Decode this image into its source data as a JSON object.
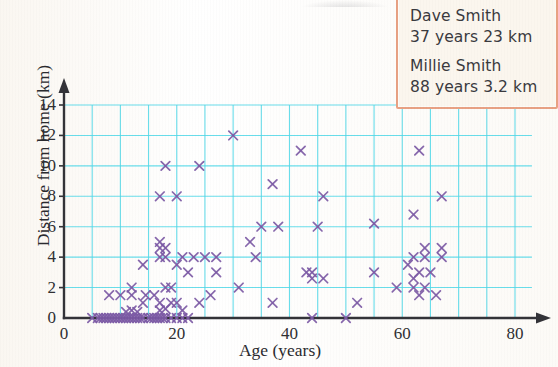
{
  "chart_data": {
    "type": "scatter",
    "title": "",
    "xlabel": "Age (years)",
    "ylabel": "Distance from home (km)",
    "xlim": [
      0,
      80
    ],
    "ylim": [
      0,
      14
    ],
    "xticks": [
      0,
      20,
      40,
      60,
      80
    ],
    "yticks": [
      0,
      2,
      4,
      6,
      8,
      10,
      12,
      14
    ],
    "x_gridline_step": 5,
    "y_gridline_step": 2,
    "grid": true,
    "grid_color": "#4fd8e8",
    "marker": "x",
    "marker_color": "#7d5ba6",
    "axis_color": "#333338",
    "legend": "none",
    "points": [
      [
        5,
        0
      ],
      [
        6,
        0
      ],
      [
        6.5,
        0
      ],
      [
        7,
        0
      ],
      [
        7.5,
        0
      ],
      [
        8,
        0
      ],
      [
        8.5,
        0
      ],
      [
        9,
        0
      ],
      [
        9.5,
        0
      ],
      [
        10,
        0
      ],
      [
        10.5,
        0
      ],
      [
        11,
        0
      ],
      [
        11.5,
        0
      ],
      [
        12,
        0
      ],
      [
        12.5,
        0
      ],
      [
        13,
        0
      ],
      [
        13.5,
        0
      ],
      [
        14,
        0
      ],
      [
        15,
        0
      ],
      [
        15.5,
        0
      ],
      [
        16,
        0
      ],
      [
        16.5,
        0
      ],
      [
        17,
        0
      ],
      [
        17.5,
        0
      ],
      [
        18,
        0
      ],
      [
        19,
        0
      ],
      [
        20,
        0
      ],
      [
        21,
        0
      ],
      [
        22,
        0
      ],
      [
        44,
        0
      ],
      [
        50,
        0
      ],
      [
        11,
        0.4
      ],
      [
        12,
        0.5
      ],
      [
        13,
        0.4
      ],
      [
        17,
        0.5
      ],
      [
        18,
        0.6
      ],
      [
        21,
        0.5
      ],
      [
        14,
        1
      ],
      [
        17,
        1
      ],
      [
        19,
        1
      ],
      [
        20,
        1
      ],
      [
        24,
        1
      ],
      [
        37,
        1
      ],
      [
        52,
        1
      ],
      [
        8,
        1.5
      ],
      [
        10,
        1.5
      ],
      [
        12,
        1.5
      ],
      [
        14.5,
        1.5
      ],
      [
        16,
        1.5
      ],
      [
        26,
        1.5
      ],
      [
        63,
        1.5
      ],
      [
        66,
        1.5
      ],
      [
        12,
        2
      ],
      [
        18,
        2
      ],
      [
        19,
        2
      ],
      [
        31,
        2
      ],
      [
        59,
        2
      ],
      [
        62,
        2
      ],
      [
        64,
        2
      ],
      [
        44,
        2.6
      ],
      [
        46,
        2.6
      ],
      [
        62,
        2.6
      ],
      [
        22,
        3
      ],
      [
        27,
        3
      ],
      [
        43,
        3
      ],
      [
        44,
        3
      ],
      [
        55,
        3
      ],
      [
        63,
        3
      ],
      [
        65,
        3
      ],
      [
        14,
        3.5
      ],
      [
        20,
        3.5
      ],
      [
        61,
        3.5
      ],
      [
        17,
        4
      ],
      [
        18,
        4
      ],
      [
        21,
        4
      ],
      [
        23,
        4
      ],
      [
        25,
        4
      ],
      [
        27,
        4
      ],
      [
        34,
        4
      ],
      [
        62,
        4
      ],
      [
        64,
        4
      ],
      [
        67,
        4
      ],
      [
        17,
        4.6
      ],
      [
        18,
        4.6
      ],
      [
        64,
        4.6
      ],
      [
        67,
        4.6
      ],
      [
        17,
        5
      ],
      [
        33,
        5
      ],
      [
        35,
        6
      ],
      [
        38,
        6
      ],
      [
        45,
        6
      ],
      [
        55,
        6.2
      ],
      [
        62,
        6.8
      ],
      [
        17,
        8
      ],
      [
        20,
        8
      ],
      [
        46,
        8
      ],
      [
        67,
        8
      ],
      [
        18,
        10
      ],
      [
        24,
        10
      ],
      [
        37,
        8.8
      ],
      [
        30,
        12
      ],
      [
        42,
        11
      ],
      [
        63,
        11
      ]
    ],
    "annotations": {
      "callout": {
        "entries": [
          {
            "name": "Dave Smith",
            "detail": "37 years 23 km"
          },
          {
            "name": "Millie Smith",
            "detail": "88 years 3.2 km"
          }
        ],
        "border_color": "#e8a183",
        "background_color": "#fbf6ee"
      }
    }
  },
  "axis": {
    "y_title": "Distance from home (km)",
    "x_title": "Age (years)",
    "y_tick_labels": [
      "0",
      "2",
      "4",
      "6",
      "8",
      "10",
      "12",
      "14"
    ],
    "x_tick_labels": [
      "0",
      "20",
      "40",
      "60",
      "80"
    ]
  },
  "callout": {
    "person1_name": "Dave Smith",
    "person1_detail": "37 years 23 km",
    "person2_name": "Millie Smith",
    "person2_detail": "88 years 3.2 km"
  }
}
